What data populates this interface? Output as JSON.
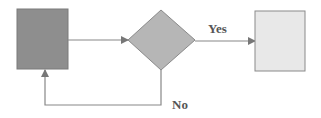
{
  "diagram": {
    "type": "flowchart",
    "nodes": [
      {
        "id": "process",
        "shape": "rectangle",
        "label": "",
        "fill": "#8e8e8e",
        "stroke": "#7a7a7a"
      },
      {
        "id": "decision",
        "shape": "diamond",
        "label": "",
        "fill": "#b6b6b6",
        "stroke": "#8a8a8a"
      },
      {
        "id": "end",
        "shape": "rectangle",
        "label": "",
        "fill": "#e8e8e8",
        "stroke": "#8a8a8a"
      }
    ],
    "edges": [
      {
        "from": "process",
        "to": "decision",
        "label": ""
      },
      {
        "from": "decision",
        "to": "end",
        "label": "Yes"
      },
      {
        "from": "decision",
        "to": "process",
        "label": "No"
      }
    ],
    "labels": {
      "yes": "Yes",
      "no": "No"
    },
    "colors": {
      "line": "#888888",
      "text": "#555555"
    }
  }
}
